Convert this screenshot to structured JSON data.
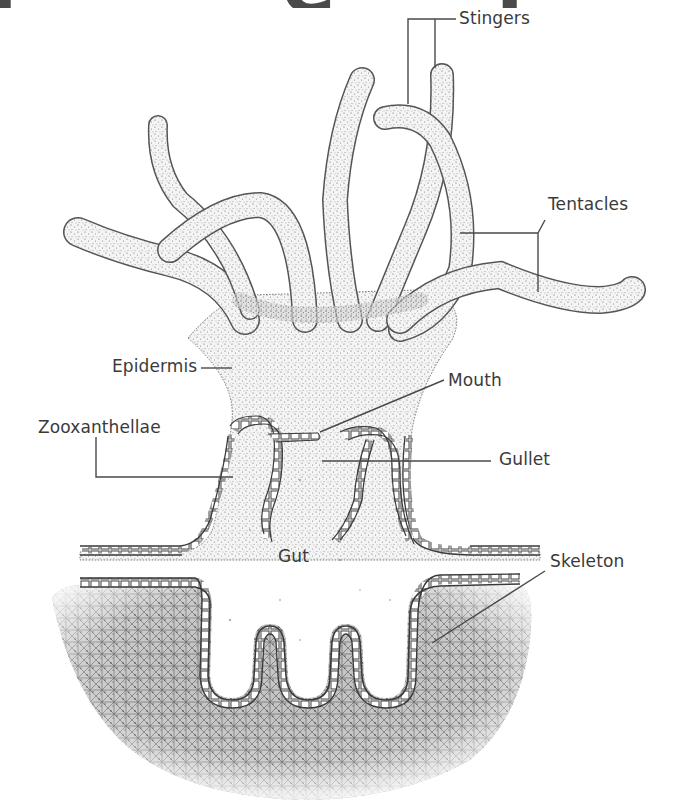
{
  "heading_fragment": "r · · e · f",
  "diagram": {
    "colors": {
      "ink": "#3a3a3a",
      "stipple": "#555555",
      "background": "#ffffff",
      "skeleton_shade": "#4d4d4d"
    },
    "labels": [
      {
        "id": "stingers",
        "text": "Stingers",
        "x": 459,
        "y": 10
      },
      {
        "id": "tentacles",
        "text": "Tentacles",
        "x": 548,
        "y": 196
      },
      {
        "id": "epidermis",
        "text": "Epidermis",
        "x": 112,
        "y": 358
      },
      {
        "id": "mouth",
        "text": "Mouth",
        "x": 448,
        "y": 372
      },
      {
        "id": "zooxanthellae",
        "text": "Zooxanthellae",
        "x": 38,
        "y": 419
      },
      {
        "id": "gullet",
        "text": "Gullet",
        "x": 499,
        "y": 451
      },
      {
        "id": "gut",
        "text": "Gut",
        "x": 278,
        "y": 548
      },
      {
        "id": "skeleton",
        "text": "Skeleton",
        "x": 550,
        "y": 553
      }
    ]
  }
}
